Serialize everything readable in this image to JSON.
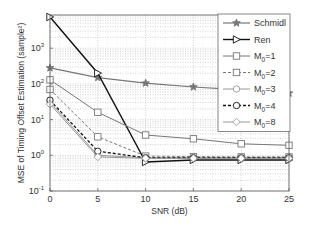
{
  "chart_data": {
    "type": "line",
    "title": "",
    "xlabel": "SNR (dB)",
    "ylabel": "MSE of Timing Offset Estimation (sample²)",
    "x": [
      0,
      5,
      10,
      15,
      20,
      25
    ],
    "xlim": [
      0,
      25
    ],
    "ylim": [
      0.1,
      8000
    ],
    "yscale": "log",
    "xticks": [
      "0",
      "5",
      "10",
      "15",
      "20",
      "25"
    ],
    "yticks": [
      {
        "base": "10",
        "exp": "-1",
        "value": 0.1
      },
      {
        "base": "10",
        "exp": "0",
        "value": 1
      },
      {
        "base": "10",
        "exp": "1",
        "value": 10
      },
      {
        "base": "10",
        "exp": "2",
        "value": 100
      },
      {
        "base": "10",
        "exp": "3",
        "value": 1000
      }
    ],
    "grid": true,
    "legend_position": "upper right",
    "series": [
      {
        "name": "Schmidl",
        "sub": "",
        "marker": "star",
        "dash": "solid",
        "color": "#777777",
        "width": 1.2,
        "values": [
          280,
          150,
          105,
          82,
          68,
          55
        ]
      },
      {
        "name": "Ren",
        "sub": "",
        "marker": "triangle-right",
        "dash": "solid",
        "color": "#111111",
        "width": 1.4,
        "values": [
          7500,
          200,
          0.65,
          0.74,
          0.74,
          0.74
        ]
      },
      {
        "name": "M",
        "sub": "0",
        "suffix": "=1",
        "marker": "square",
        "dash": "solid",
        "color": "#777777",
        "width": 1.0,
        "values": [
          130,
          16,
          3.7,
          2.9,
          2.1,
          1.9
        ]
      },
      {
        "name": "M",
        "sub": "0",
        "suffix": "=2",
        "marker": "square",
        "dash": "dashed",
        "color": "#777777",
        "width": 1.0,
        "values": [
          70,
          3.3,
          0.95,
          0.92,
          0.9,
          0.9
        ]
      },
      {
        "name": "M",
        "sub": "0",
        "suffix": "=3",
        "marker": "circle",
        "dash": "solid",
        "color": "#999999",
        "width": 1.0,
        "values": [
          31,
          1.0,
          0.85,
          0.85,
          0.85,
          0.85
        ]
      },
      {
        "name": "M",
        "sub": "0",
        "suffix": "=4",
        "marker": "circle",
        "dash": "dashed",
        "color": "#111111",
        "width": 1.3,
        "values": [
          35,
          1.3,
          0.85,
          0.85,
          0.85,
          0.85
        ]
      },
      {
        "name": "M",
        "sub": "0",
        "suffix": "=8",
        "marker": "diamond",
        "dash": "solid",
        "color": "#999999",
        "width": 1.0,
        "values": [
          27,
          0.9,
          0.82,
          0.82,
          0.82,
          0.82
        ]
      }
    ]
  }
}
